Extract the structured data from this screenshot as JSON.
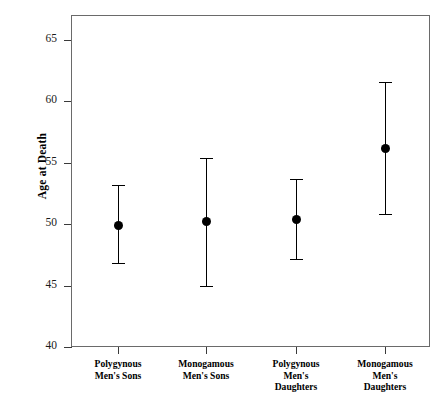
{
  "chart_data": {
    "type": "scatter",
    "title": "",
    "xlabel": "",
    "ylabel": "Age at Death",
    "ylim": [
      40,
      65
    ],
    "yticks": [
      40,
      45,
      50,
      55,
      60,
      65
    ],
    "ytick_labels": [
      "40",
      "45",
      "50",
      "55",
      "60",
      "65"
    ],
    "grid": false,
    "legend": "none",
    "error_bar_style": "capped-vertical",
    "categories": [
      "Polygynous Men's Sons",
      "Monogamous Men's Sons",
      "Polygynous Men's Daughters",
      "Monogamous Men's Daughters"
    ],
    "category_label_lines": [
      [
        "Polygynous",
        "Men's Sons"
      ],
      [
        "Monogamous",
        "Men's Sons"
      ],
      [
        "Polygynous",
        "Men's",
        "Daughters"
      ],
      [
        "Monogamous",
        "Men's",
        "Daughters"
      ]
    ],
    "values": [
      49.9,
      50.2,
      50.4,
      56.2
    ],
    "error_low": [
      46.8,
      45.0,
      47.2,
      50.8
    ],
    "error_high": [
      53.2,
      55.4,
      53.7,
      61.6
    ],
    "points": [
      {
        "category": "Polygynous Men's Sons",
        "mean": 49.9,
        "lower": 46.8,
        "upper": 53.2
      },
      {
        "category": "Monogamous Men's Sons",
        "mean": 50.2,
        "lower": 45.0,
        "upper": 55.4
      },
      {
        "category": "Polygynous Men's Daughters",
        "mean": 50.4,
        "lower": 47.2,
        "upper": 53.7
      },
      {
        "category": "Monogamous Men's Daughters",
        "mean": 56.2,
        "lower": 50.8,
        "upper": 61.6
      }
    ],
    "colors": {
      "marker": "#000000",
      "error_bar": "#000000",
      "frame": "#6a6a6a",
      "tick": "#3a3a3a",
      "background": "#ffffff"
    }
  }
}
